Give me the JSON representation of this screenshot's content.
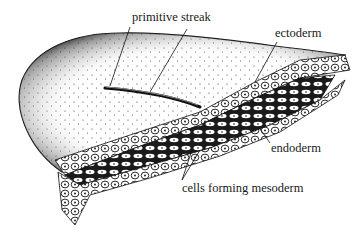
{
  "figure": {
    "labels": [
      {
        "id": "primitive-streak",
        "text": "primitive streak"
      },
      {
        "id": "ectoderm",
        "text": "ectoderm"
      },
      {
        "id": "endoderm",
        "text": "endoderm"
      },
      {
        "id": "mesoderm",
        "text": "cells forming mesoderm"
      }
    ],
    "colors": {
      "ink": "#1a1a1a",
      "background": "#ffffff",
      "stipple": "#222222"
    }
  }
}
